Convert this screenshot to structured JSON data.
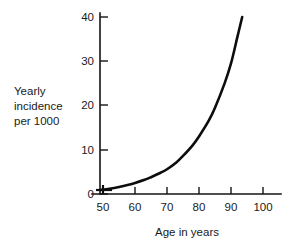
{
  "chart_data": {
    "type": "line",
    "title": "",
    "xlabel": "Age in years",
    "ylabel": "Yearly incidence per 1000",
    "ylabel_lines": [
      "Yearly",
      "incidence",
      "per 1000"
    ],
    "xlim": [
      45,
      105
    ],
    "ylim": [
      0,
      40
    ],
    "grid": false,
    "legend": null,
    "x_ticks": [
      50,
      60,
      70,
      80,
      90,
      100
    ],
    "x_tick_labels": [
      "50",
      "60",
      "70",
      "80",
      "90",
      "100"
    ],
    "y_ticks": [
      0,
      10,
      20,
      30,
      40
    ],
    "y_tick_labels": [
      "0",
      "10",
      "20",
      "30",
      "40"
    ],
    "series": [
      {
        "name": "Yearly incidence per 1000",
        "x": [
          49,
          52,
          55,
          58,
          60,
          63,
          65,
          68,
          70,
          73,
          75,
          78,
          80,
          83,
          85,
          88,
          90,
          92,
          93.5
        ],
        "values": [
          0.9,
          1.2,
          1.6,
          2.1,
          2.5,
          3.2,
          3.8,
          4.8,
          5.6,
          7.2,
          8.6,
          11.0,
          13.0,
          16.5,
          19.5,
          25.0,
          29.5,
          35.5,
          40.0
        ],
        "color": "#0d0d0d",
        "line_width": 2.6
      }
    ],
    "annotations": [
      {
        "name": "origin-marker",
        "x": 49,
        "y": 0.9,
        "description": "short horizontal bar with vertical tick at curve start"
      }
    ]
  },
  "axis_colors": {
    "axis": "#141414",
    "text": "#1a1a1a",
    "curve": "#0d0d0d",
    "background": "#ffffff"
  }
}
